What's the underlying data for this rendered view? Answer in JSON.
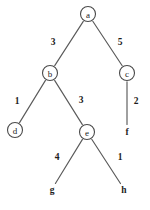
{
  "figure": {
    "type": "weighted-tree-diagram",
    "background_color": "#ffffff",
    "edge_color": "#5a5a5a",
    "node_stroke_color": "#4a4a4a",
    "text_color": "#1c1c1c"
  },
  "chart_data": {
    "type": "diagram",
    "title": "",
    "nodes": [
      {
        "id": "a",
        "label": "a",
        "x": 88,
        "y": 14,
        "r": 7.5,
        "circled": true
      },
      {
        "id": "b",
        "label": "b",
        "x": 50,
        "y": 73,
        "r": 7.5,
        "circled": true
      },
      {
        "id": "c",
        "label": "c",
        "x": 127,
        "y": 73,
        "r": 7.5,
        "circled": true
      },
      {
        "id": "d",
        "label": "d",
        "x": 15,
        "y": 130,
        "r": 7.5,
        "circled": true
      },
      {
        "id": "e",
        "label": "e",
        "x": 87,
        "y": 132,
        "r": 7.5,
        "circled": true
      },
      {
        "id": "f",
        "label": "f",
        "x": 127,
        "y": 131,
        "r": 0,
        "circled": false
      },
      {
        "id": "g",
        "label": "g",
        "x": 52,
        "y": 189,
        "r": 0,
        "circled": false
      },
      {
        "id": "h",
        "label": "h",
        "x": 124,
        "y": 189,
        "r": 0,
        "circled": false
      }
    ],
    "edges": [
      {
        "from": "a",
        "to": "b",
        "weight": "3",
        "label_x": 53,
        "label_y": 42
      },
      {
        "from": "a",
        "to": "c",
        "weight": "5",
        "label_x": 120,
        "label_y": 42
      },
      {
        "from": "b",
        "to": "d",
        "weight": "1",
        "label_x": 17,
        "label_y": 101
      },
      {
        "from": "b",
        "to": "e",
        "weight": "3",
        "label_x": 81,
        "label_y": 100
      },
      {
        "from": "c",
        "to": "f",
        "weight": "2",
        "label_x": 136,
        "label_y": 101
      },
      {
        "from": "e",
        "to": "g",
        "weight": "4",
        "label_x": 57,
        "label_y": 157
      },
      {
        "from": "e",
        "to": "h",
        "weight": "1",
        "label_x": 120,
        "label_y": 157
      }
    ]
  }
}
